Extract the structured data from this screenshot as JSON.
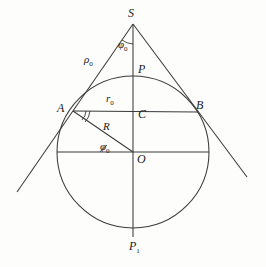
{
  "figure": {
    "type": "geometry-diagram",
    "stroke_color": "#3a3a3a",
    "background_color": "#fdfdfb",
    "canvas": {
      "width": 266,
      "height": 267
    },
    "circle": {
      "cx": 133,
      "cy": 152,
      "r": 76
    },
    "points": {
      "S": {
        "x": 133,
        "y": 24,
        "label": "S",
        "label_x": 128,
        "label_y": 9
      },
      "P": {
        "x": 133,
        "y": 77,
        "label": "P",
        "label_x": 138,
        "label_y": 64
      },
      "A": {
        "x": 73,
        "y": 111,
        "label": "A",
        "label_x": 58,
        "label_y": 103
      },
      "B": {
        "x": 198,
        "y": 112,
        "label": "B",
        "label_x": 197,
        "label_y": 100
      },
      "C": {
        "x": 133,
        "y": 112,
        "label": "C",
        "label_x": 138,
        "label_y": 110
      },
      "O": {
        "x": 133,
        "y": 152,
        "label": "O",
        "label_x": 138,
        "label_y": 154
      },
      "P1": {
        "x": 133,
        "y": 228,
        "label": "P",
        "label_sub": "1",
        "label_x": 130,
        "label_y": 241
      }
    },
    "measures": {
      "rho0": {
        "label": "ρ",
        "sub": "0",
        "x": 85,
        "y": 55,
        "meaning": "tangent-length-S-to-A"
      },
      "r0": {
        "label": "r",
        "sub": "0",
        "x": 107,
        "y": 94,
        "meaning": "half-chord-radius"
      },
      "R": {
        "label": "R",
        "sub": "",
        "x": 104,
        "y": 122,
        "meaning": "sphere-radius"
      },
      "phi0_S": {
        "label": "φ",
        "sub": "0",
        "x": 119,
        "y": 40,
        "meaning": "half-apex-angle"
      },
      "phi0_O": {
        "label": "φ",
        "sub": "0",
        "x": 101,
        "y": 142,
        "meaning": "angle-at-center"
      }
    },
    "tangents": {
      "left": {
        "x1": 17,
        "y1": 192,
        "x2": 133,
        "y2": 24
      },
      "right": {
        "x1": 247,
        "y1": 177,
        "x2": 133,
        "y2": 24
      }
    },
    "segments": [
      {
        "name": "axis-S-to-P1",
        "x1": 133,
        "y1": 24,
        "x2": 133,
        "y2": 237
      },
      {
        "name": "chord-A-to-B",
        "x1": 73,
        "y1": 111,
        "x2": 198,
        "y2": 112
      },
      {
        "name": "radius-A-to-O",
        "x1": 73,
        "y1": 111,
        "x2": 133,
        "y2": 152
      },
      {
        "name": "diameter-horiz",
        "x1": 57,
        "y1": 152,
        "x2": 209,
        "y2": 152
      }
    ],
    "markers": {
      "right_angle_at_A": true,
      "arc_at_S": true,
      "arc_at_O": true
    }
  }
}
